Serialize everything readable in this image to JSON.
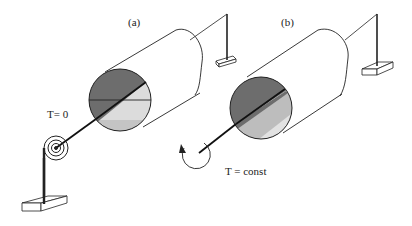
{
  "figure": {
    "panel_a": {
      "label": "(a)",
      "torque_label": "T= 0",
      "colors": {
        "dark": "#6d6d6d",
        "light": "#dcdcdc",
        "lighter": "#c4c4c4"
      }
    },
    "panel_b": {
      "label": "(b)",
      "torque_label": "T = const",
      "colors": {
        "dark": "#6d6d6d",
        "light": "#e2e2e2",
        "mid": "#bdbdbd"
      }
    }
  }
}
